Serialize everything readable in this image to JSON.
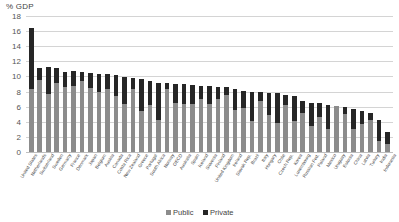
{
  "chart_data": {
    "type": "bar",
    "subtype": "stacked-column",
    "title": "",
    "ylabel": "% GDP",
    "xlabel": "",
    "ylim": [
      0,
      18
    ],
    "ytick_step": 2,
    "yticks": [
      0,
      2,
      4,
      6,
      8,
      10,
      12,
      14,
      16,
      18
    ],
    "grid": true,
    "legend_position": "bottom",
    "legend": [
      "Public",
      "Private"
    ],
    "colors": {
      "public": "#8c8c8c",
      "private": "#262626",
      "gridline": "#d4d4d4",
      "text": "#4a4a4a",
      "background": "#ffffff"
    },
    "categories": [
      "United States",
      "Netherlands",
      "Switzerland",
      "Sweden",
      "Germany",
      "France",
      "Denmark",
      "Japan",
      "Belgium",
      "Austria",
      "Canada",
      "Costa Rica",
      "New Zealand",
      "Greece",
      "Portugal",
      "South Africa",
      "Norway",
      "OECD",
      "Australia",
      "Spain",
      "Iceland",
      "Slovenia",
      "Finland",
      "United Kingdom",
      "Ireland",
      "Slovak Rep.",
      "Brazil",
      "Italy",
      "Hungary",
      "Chile",
      "Czech Rep.",
      "Korea",
      "Luxembourg",
      "Russian Fed.",
      "Poland",
      "Mexico",
      "Uruguay",
      "Estonia",
      "China",
      "Latvia",
      "Turkey",
      "India",
      "Indonesia"
    ],
    "series": [
      {
        "name": "Public",
        "color": "#8c8c8c",
        "values": [
          8.3,
          9.5,
          7.7,
          9.2,
          8.6,
          8.7,
          9.4,
          8.5,
          8.0,
          8.4,
          7.4,
          6.3,
          8.3,
          5.4,
          6.2,
          4.3,
          8.3,
          6.5,
          6.3,
          6.4,
          7.0,
          6.4,
          7.0,
          7.6,
          5.5,
          5.8,
          4.1,
          6.8,
          4.9,
          3.9,
          6.2,
          4.1,
          5.2,
          3.5,
          4.6,
          3.1,
          6.1,
          5.0,
          3.1,
          3.7,
          4.2,
          1.4,
          1.1
        ]
      },
      {
        "name": "Private",
        "color": "#262626",
        "values": [
          8.1,
          1.6,
          3.5,
          1.9,
          2.0,
          2.0,
          1.2,
          1.9,
          2.3,
          1.9,
          2.8,
          3.6,
          1.5,
          4.2,
          3.2,
          4.9,
          0.8,
          2.5,
          2.7,
          2.5,
          1.8,
          2.4,
          1.6,
          1.0,
          2.9,
          2.3,
          3.9,
          1.2,
          2.9,
          3.9,
          1.4,
          3.3,
          1.5,
          3.0,
          1.9,
          3.1,
          0.0,
          0.9,
          2.6,
          1.7,
          1.0,
          2.8,
          1.6
        ]
      }
    ]
  }
}
